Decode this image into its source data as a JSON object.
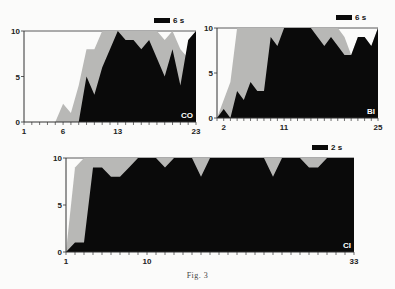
{
  "figure": {
    "caption": "Fig. 3"
  },
  "colors": {
    "black_series": "#0a0a0a",
    "grey_series": "#b8b8b6",
    "background": "#fbfbfa",
    "axis": "#333333"
  },
  "chart_data": [
    {
      "type": "area",
      "panel_label": "CO",
      "scale_bar_label": "6 s",
      "xlabel": "",
      "ylabel": "",
      "xlim": [
        1,
        23
      ],
      "ylim": [
        0,
        10
      ],
      "x_tick_labels": [
        {
          "x": 1,
          "label": "1"
        },
        {
          "x": 6,
          "label": "6"
        },
        {
          "x": 13,
          "label": "13"
        },
        {
          "x": 23,
          "label": "23"
        }
      ],
      "y_tick_labels": [
        {
          "y": 0,
          "label": "0"
        },
        {
          "y": 5,
          "label": "5"
        },
        {
          "y": 10,
          "label": "10"
        }
      ],
      "frame": {
        "left": 24,
        "right": 196,
        "top": 31,
        "bottom": 122
      },
      "x": [
        1,
        2,
        3,
        4,
        5,
        6,
        7,
        8,
        9,
        10,
        11,
        12,
        13,
        14,
        15,
        16,
        17,
        18,
        19,
        20,
        21,
        22,
        23
      ],
      "series": [
        {
          "name": "grey (upper)",
          "values": [
            0,
            0,
            0,
            0,
            0,
            2,
            1,
            4,
            8,
            8,
            10,
            10,
            10,
            10,
            10,
            10,
            10,
            10,
            9,
            10,
            8,
            7,
            10
          ]
        },
        {
          "name": "black (lower)",
          "values": [
            0,
            0,
            0,
            0,
            0,
            0,
            0,
            0,
            5,
            3,
            6,
            8,
            10,
            9,
            9,
            8,
            9,
            7,
            5,
            8,
            4,
            9,
            10
          ]
        }
      ]
    },
    {
      "type": "area",
      "panel_label": "BI",
      "scale_bar_label": "6 s",
      "xlabel": "",
      "ylabel": "",
      "xlim": [
        1,
        25
      ],
      "ylim": [
        0,
        10
      ],
      "x_tick_labels": [
        {
          "x": 2,
          "label": "2"
        },
        {
          "x": 11,
          "label": "11"
        },
        {
          "x": 25,
          "label": "25"
        }
      ],
      "y_tick_labels": [
        {
          "y": 0,
          "label": "0"
        },
        {
          "y": 5,
          "label": "5"
        },
        {
          "y": 10,
          "label": "10"
        }
      ],
      "frame": {
        "left": 217,
        "right": 378,
        "top": 28,
        "bottom": 118
      },
      "x": [
        1,
        2,
        3,
        4,
        5,
        6,
        7,
        8,
        9,
        10,
        11,
        12,
        13,
        14,
        15,
        16,
        17,
        18,
        19,
        20,
        21,
        22,
        23,
        24,
        25
      ],
      "series": [
        {
          "name": "grey (upper)",
          "values": [
            0,
            2,
            4,
            10,
            10,
            10,
            10,
            10,
            10,
            10,
            10,
            10,
            10,
            10,
            10,
            10,
            10,
            10,
            10,
            9,
            7,
            9,
            9,
            8,
            10
          ]
        },
        {
          "name": "black (lower)",
          "values": [
            0,
            1,
            0,
            3,
            2,
            4,
            3,
            3,
            9,
            8,
            10,
            10,
            10,
            10,
            10,
            9,
            8,
            9,
            8,
            7,
            7,
            9,
            9,
            8,
            10
          ]
        }
      ]
    },
    {
      "type": "area",
      "panel_label": "CI",
      "scale_bar_label": "2 s",
      "xlabel": "",
      "ylabel": "",
      "xlim": [
        1,
        33
      ],
      "ylim": [
        0,
        10
      ],
      "x_tick_labels": [
        {
          "x": 1,
          "label": "1"
        },
        {
          "x": 10,
          "label": "10"
        },
        {
          "x": 33,
          "label": "33"
        }
      ],
      "y_tick_labels": [
        {
          "y": 0,
          "label": "0"
        },
        {
          "y": 5,
          "label": "5"
        },
        {
          "y": 10,
          "label": "10"
        }
      ],
      "frame": {
        "left": 66,
        "right": 354,
        "top": 158,
        "bottom": 252
      },
      "x": [
        1,
        2,
        3,
        4,
        5,
        6,
        7,
        8,
        9,
        10,
        11,
        12,
        13,
        14,
        15,
        16,
        17,
        18,
        19,
        20,
        21,
        22,
        23,
        24,
        25,
        26,
        27,
        28,
        29,
        30,
        31,
        32,
        33
      ],
      "series": [
        {
          "name": "grey (upper)",
          "values": [
            0,
            9,
            10,
            10,
            10,
            10,
            10,
            10,
            10,
            10,
            10,
            10,
            10,
            10,
            10,
            10,
            10,
            10,
            10,
            10,
            10,
            10,
            10,
            10,
            10,
            10,
            10,
            10,
            10,
            10,
            10,
            10,
            10
          ]
        },
        {
          "name": "black (lower)",
          "values": [
            0,
            1,
            1,
            9,
            9,
            8,
            8,
            9,
            10,
            10,
            10,
            9,
            10,
            10,
            10,
            8,
            10,
            10,
            10,
            10,
            10,
            10,
            10,
            8,
            10,
            10,
            10,
            9,
            9,
            10,
            10,
            10,
            10
          ]
        }
      ]
    }
  ]
}
